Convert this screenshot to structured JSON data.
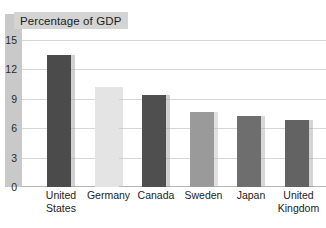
{
  "chart_data": {
    "type": "bar",
    "title": "Percentage of GDP",
    "xlabel": "",
    "ylabel": "",
    "ylim": [
      0,
      15
    ],
    "yticks": [
      0,
      3,
      6,
      9,
      12,
      15
    ],
    "grid": true,
    "legend": "none",
    "categories": [
      "United States",
      "Germany",
      "Canada",
      "Sweden",
      "Japan",
      "United Kingdom"
    ],
    "category_lines": [
      [
        "United",
        "States"
      ],
      [
        "Germany",
        ""
      ],
      [
        "Canada",
        ""
      ],
      [
        "Sweden",
        ""
      ],
      [
        "Japan",
        ""
      ],
      [
        "United",
        "Kingdom"
      ]
    ],
    "values": [
      13.5,
      10.2,
      9.4,
      7.7,
      7.2,
      6.8
    ],
    "bar_colors": [
      "#4b4b4b",
      "#e4e4e4",
      "#4f4f4f",
      "#9a9a9a",
      "#6e6e6e",
      "#636363"
    ],
    "shadow_colors": [
      "#9a9a9a",
      "#c4c4c4",
      "#9a9a9a",
      "#bdbdbd",
      "#a8a8a8",
      "#a0a0a0"
    ]
  },
  "axis": {
    "tick_labels": [
      "15",
      "12",
      "9",
      "6",
      "3",
      "0"
    ]
  },
  "colors": {
    "title_band": "#d4d4d4",
    "left_band": "#c9c9c9",
    "gridline": "#d6d6d6",
    "baseline": "#b4b4b4",
    "background": "#ffffff",
    "text": "#1c1c1c"
  }
}
